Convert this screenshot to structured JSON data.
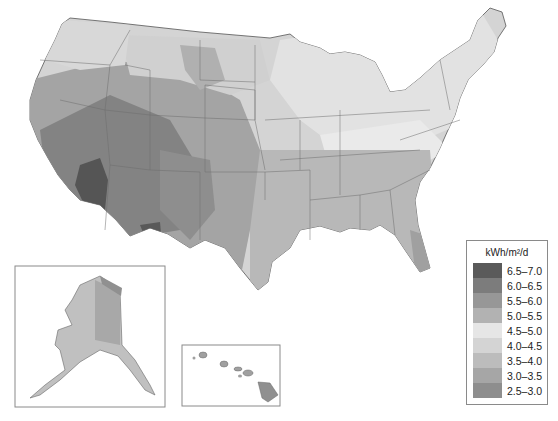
{
  "map": {
    "subject": "Average daily solar radiation, United States",
    "regions": [
      "Contiguous United States",
      "Alaska",
      "Hawaii"
    ]
  },
  "legend": {
    "title": "kWh/m²/d",
    "items": [
      {
        "label": "6.5–7.0",
        "color": "#5a5a5a"
      },
      {
        "label": "6.0–6.5",
        "color": "#7c7c7c"
      },
      {
        "label": "5.5–6.0",
        "color": "#979797"
      },
      {
        "label": "5.0–5.5",
        "color": "#b2b2b2"
      },
      {
        "label": "4.5–5.0",
        "color": "#e6e6e6"
      },
      {
        "label": "4.0–4.5",
        "color": "#d4d4d4"
      },
      {
        "label": "3.5–4.0",
        "color": "#bcbcbc"
      },
      {
        "label": "3.0–3.5",
        "color": "#a6a6a6"
      },
      {
        "label": "2.5–3.0",
        "color": "#8e8e8e"
      }
    ]
  }
}
